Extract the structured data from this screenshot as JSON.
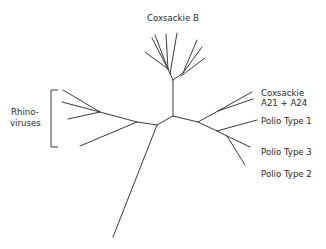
{
  "diagram": {
    "type": "unrooted-phylogenetic-tree",
    "stroke_color": "#3a3a3a",
    "text_color": "#2a2a2a",
    "labels": {
      "coxsackie_b": "Coxsackie B",
      "rhino_line1": "Rhino-",
      "rhino_line2": "viruses",
      "coxsackie_a_line1": "Coxsackie",
      "coxsackie_a_line2": "A21 + A24",
      "polio_1": "Polio Type 1",
      "polio_3": "Polio Type 3",
      "polio_2": "Polio Type 2"
    },
    "clades": [
      {
        "name": "Coxsackie B",
        "leaves": 8
      },
      {
        "name": "Rhinoviruses",
        "leaves": 4
      },
      {
        "name": "Coxsackie A21 + A24",
        "leaves": 2
      },
      {
        "name": "Polio Type 1",
        "leaves": 1
      },
      {
        "name": "Polio Type 3",
        "leaves": 1
      },
      {
        "name": "Polio Type 2",
        "leaves": 1
      }
    ]
  }
}
